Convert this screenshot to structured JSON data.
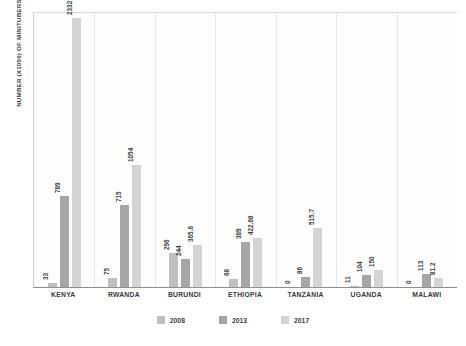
{
  "chart_data": {
    "type": "bar",
    "title": "",
    "subtitle": "",
    "xlabel": "",
    "ylabel": "NUMBER (X1000) OF MINITUBERS PRODUCED",
    "categories": [
      "KENYA",
      "RWANDA",
      "BURUNDI",
      "ETHIOPIA",
      "TANZANIA",
      "UGANDA",
      "MALAWI"
    ],
    "series": [
      {
        "name": "2008",
        "color": "#bfbfbf",
        "values": [
          33,
          75,
          296,
          68,
          0,
          11,
          0
        ],
        "labels": [
          "33",
          "75",
          "296",
          "68",
          "0",
          "11",
          "0"
        ]
      },
      {
        "name": "2013",
        "color": "#a6a6a6",
        "values": [
          789,
          715,
          244,
          389,
          86,
          104,
          113
        ],
        "labels": [
          "789",
          "715",
          "244",
          "389",
          "86",
          "104",
          "113"
        ]
      },
      {
        "name": "2017",
        "color": "#d4d4d4",
        "values": [
          2332,
          1054,
          365.6,
          422.68,
          515.7,
          150,
          81.2
        ],
        "labels": [
          "2332",
          "1054",
          "365.6",
          "422.68",
          "515.7",
          "150",
          "81.2"
        ]
      }
    ],
    "ylim": [
      0,
      2332
    ],
    "grid": "vertical-group-separators",
    "legend_position": "bottom-center",
    "legend_entries": [
      "2008",
      "2013",
      "2017"
    ]
  }
}
